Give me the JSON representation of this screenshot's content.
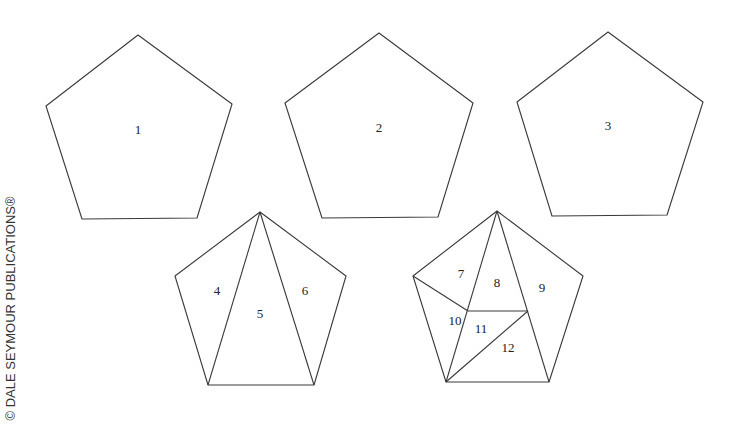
{
  "copyright": "© DALE SEYMOUR PUBLICATIONS®",
  "shapes": [
    {
      "id": "pentagon-1",
      "points": "138,35 232,104 197,218 82,219 46,106",
      "lines": [],
      "labels": [
        {
          "text": "1",
          "x": 138,
          "y": 131
        }
      ]
    },
    {
      "id": "pentagon-2",
      "points": "379,33 473,103 438,217 322,218 285,103",
      "lines": [],
      "labels": [
        {
          "text": "2",
          "x": 379,
          "y": 129
        }
      ]
    },
    {
      "id": "pentagon-3",
      "points": "608,32 703,102 667,215 552,216 517,102",
      "lines": [],
      "labels": [
        {
          "text": "3",
          "x": 608,
          "y": 127
        }
      ]
    },
    {
      "id": "pentagon-4",
      "points": "260,212 346,276 314,385 208,385 175,276",
      "lines": [
        [
          260,
          212,
          208,
          385
        ],
        [
          260,
          212,
          314,
          385
        ]
      ],
      "labels": [
        {
          "text": "4",
          "x": 217,
          "y": 292
        },
        {
          "text": "5",
          "x": 260,
          "y": 315
        },
        {
          "text": "6",
          "x": 305,
          "y": 292
        }
      ]
    },
    {
      "id": "pentagon-5",
      "points": "497,211 583,276 549,382 446,382 413,276",
      "lines": [
        [
          497,
          211,
          446,
          382
        ],
        [
          497,
          211,
          549,
          382
        ],
        [
          413,
          276,
          468,
          311
        ],
        [
          468,
          311,
          528,
          311
        ],
        [
          528,
          311,
          446,
          382
        ]
      ],
      "labels": [
        {
          "text": "7",
          "x": 461,
          "y": 275
        },
        {
          "text": "8",
          "x": 497,
          "y": 284
        },
        {
          "text": "9",
          "x": 542,
          "y": 289
        },
        {
          "text": "10",
          "x": 455,
          "y": 322
        },
        {
          "text": "11",
          "x": 481,
          "y": 330
        },
        {
          "text": "12",
          "x": 508,
          "y": 349
        }
      ]
    }
  ]
}
